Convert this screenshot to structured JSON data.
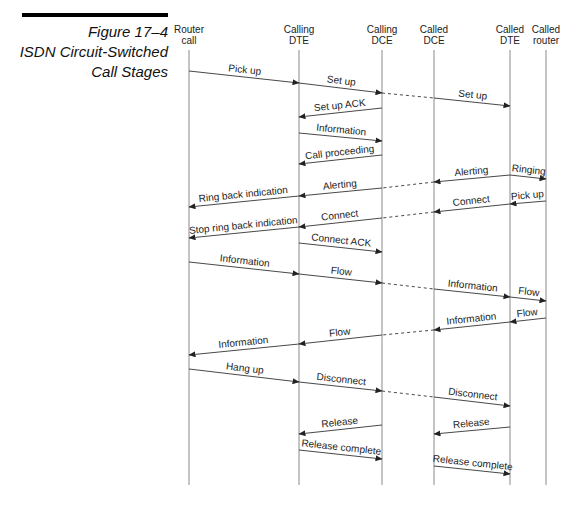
{
  "figure": {
    "number": "Figure 17–4",
    "title_line1": "ISDN Circuit-Switched",
    "title_line2": "Call Stages"
  },
  "lifelines": [
    {
      "id": "router",
      "line1": "Router",
      "line2": "call",
      "x": 189
    },
    {
      "id": "calling-dte",
      "line1": "Calling",
      "line2": "DTE",
      "x": 299
    },
    {
      "id": "calling-dce",
      "line1": "Calling",
      "line2": "DCE",
      "x": 382
    },
    {
      "id": "called-dce",
      "line1": "Called",
      "line2": "DCE",
      "x": 434
    },
    {
      "id": "called-dte",
      "line1": "Called",
      "line2": "DTE",
      "x": 510
    },
    {
      "id": "called-router",
      "line1": "Called",
      "line2": "router",
      "x": 546
    }
  ],
  "lifeline_top": 50,
  "lifeline_bottom": 485,
  "messages": [
    {
      "label": "Pick up",
      "from": 189,
      "to": 299,
      "y1": 71,
      "y2": 83
    },
    {
      "label": "Set up",
      "from": 299,
      "to": 382,
      "y1": 83,
      "y2": 93
    },
    {
      "label": "",
      "from": 382,
      "to": 434,
      "y1": 93,
      "y2": 98,
      "dashed": true,
      "noarrow": true
    },
    {
      "label": "Set up",
      "from": 434,
      "to": 510,
      "y1": 98,
      "y2": 106
    },
    {
      "label": "Set up ACK",
      "from": 382,
      "to": 299,
      "y1": 108,
      "y2": 117
    },
    {
      "label": "Information",
      "from": 299,
      "to": 382,
      "y1": 133,
      "y2": 141
    },
    {
      "label": "Call proceeding",
      "from": 382,
      "to": 299,
      "y1": 155,
      "y2": 164
    },
    {
      "label": "Ringing",
      "from": 510,
      "to": 546,
      "y1": 175,
      "y2": 179
    },
    {
      "label": "Alerting",
      "from": 510,
      "to": 434,
      "y1": 175,
      "y2": 182
    },
    {
      "label": "",
      "from": 434,
      "to": 382,
      "y1": 182,
      "y2": 188,
      "dashed": true,
      "noarrow": true
    },
    {
      "label": "Alerting",
      "from": 382,
      "to": 299,
      "y1": 188,
      "y2": 196
    },
    {
      "label": "Ring back indication",
      "from": 299,
      "to": 189,
      "y1": 196,
      "y2": 207
    },
    {
      "label": "Pick up",
      "from": 546,
      "to": 510,
      "y1": 201,
      "y2": 204
    },
    {
      "label": "Connect",
      "from": 510,
      "to": 434,
      "y1": 204,
      "y2": 212
    },
    {
      "label": "",
      "from": 434,
      "to": 382,
      "y1": 212,
      "y2": 218,
      "dashed": true,
      "noarrow": true
    },
    {
      "label": "Connect",
      "from": 382,
      "to": 299,
      "y1": 218,
      "y2": 227
    },
    {
      "label": "Stop ring back indication",
      "from": 299,
      "to": 189,
      "y1": 227,
      "y2": 238
    },
    {
      "label": "Connect ACK",
      "from": 299,
      "to": 382,
      "y1": 243,
      "y2": 252
    },
    {
      "label": "Information",
      "from": 189,
      "to": 299,
      "y1": 262,
      "y2": 274
    },
    {
      "label": "Flow",
      "from": 299,
      "to": 382,
      "y1": 274,
      "y2": 283
    },
    {
      "label": "",
      "from": 382,
      "to": 434,
      "y1": 283,
      "y2": 289,
      "dashed": true,
      "noarrow": true
    },
    {
      "label": "Information",
      "from": 434,
      "to": 510,
      "y1": 289,
      "y2": 297
    },
    {
      "label": "Flow",
      "from": 510,
      "to": 546,
      "y1": 297,
      "y2": 301
    },
    {
      "label": "Flow",
      "from": 546,
      "to": 510,
      "y1": 318,
      "y2": 322
    },
    {
      "label": "Information",
      "from": 510,
      "to": 434,
      "y1": 322,
      "y2": 330
    },
    {
      "label": "",
      "from": 434,
      "to": 382,
      "y1": 330,
      "y2": 335,
      "dashed": true,
      "noarrow": true
    },
    {
      "label": "Flow",
      "from": 382,
      "to": 299,
      "y1": 335,
      "y2": 344
    },
    {
      "label": "Information",
      "from": 299,
      "to": 189,
      "y1": 344,
      "y2": 355
    },
    {
      "label": "Hang up",
      "from": 189,
      "to": 299,
      "y1": 369,
      "y2": 382
    },
    {
      "label": "Disconnect",
      "from": 299,
      "to": 382,
      "y1": 382,
      "y2": 391
    },
    {
      "label": "",
      "from": 382,
      "to": 434,
      "y1": 391,
      "y2": 397,
      "dashed": true,
      "noarrow": true
    },
    {
      "label": "Disconnect",
      "from": 434,
      "to": 510,
      "y1": 397,
      "y2": 406
    },
    {
      "label": "Release",
      "from": 382,
      "to": 299,
      "y1": 425,
      "y2": 434
    },
    {
      "label": "Release",
      "from": 510,
      "to": 434,
      "y1": 427,
      "y2": 434
    },
    {
      "label": "Release complete",
      "from": 299,
      "to": 382,
      "y1": 450,
      "y2": 459
    },
    {
      "label": "Release complete",
      "from": 434,
      "to": 510,
      "y1": 466,
      "y2": 474
    }
  ],
  "colors": {
    "lifeline": "#8a8a8a",
    "arrow": "#333333",
    "text": "#222222"
  }
}
